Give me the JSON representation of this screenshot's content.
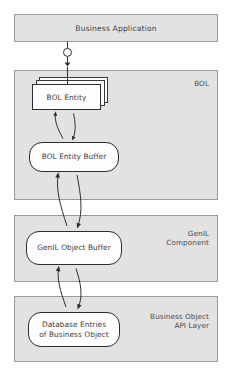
{
  "diagram": {
    "type": "layered-architecture-diagram",
    "app_box": {
      "label": "Business Application"
    },
    "socket": {
      "icon": "interface-socket-icon",
      "label": "–"
    },
    "layers": [
      {
        "id": "bol",
        "label": "BOL",
        "nodes": [
          {
            "id": "bol-entity",
            "label": "BOL Entity",
            "shape": "stacked-rectangle"
          },
          {
            "id": "bol-entity-buffer",
            "label": "BOL Entity Buffer",
            "shape": "rounded-rectangle"
          }
        ]
      },
      {
        "id": "genil",
        "label": "GenIL\nComponent",
        "nodes": [
          {
            "id": "genil-object-buffer",
            "label": "GenIL Object Buffer",
            "shape": "rounded-rectangle"
          }
        ]
      },
      {
        "id": "bo-api",
        "label": "Business Object\nAPI Layer",
        "nodes": [
          {
            "id": "database-entries",
            "label": "Database Entries\nof Business Object",
            "shape": "rounded-rectangle"
          }
        ]
      }
    ],
    "connectors": [
      {
        "id": "app-to-bol",
        "kind": "straight-arrow",
        "direction": "down"
      },
      {
        "id": "entity-to-buffer",
        "kind": "curved-bidirectional"
      },
      {
        "id": "buffer-to-genil",
        "kind": "curved-bidirectional"
      },
      {
        "id": "genil-to-boapi",
        "kind": "curved-bidirectional"
      }
    ],
    "caption": "",
    "colors": {
      "layer_fill": "#e2e2e2",
      "layer_border": "#9a9a9a",
      "node_fill": "#fdfdfd",
      "node_border": "#2d2d2d",
      "text": "#3d3d3d",
      "label_text": "#4a4a4a",
      "background": "#ffffff"
    }
  }
}
